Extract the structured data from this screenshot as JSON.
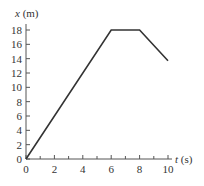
{
  "chart_data": {
    "type": "line",
    "title": "",
    "xlabel": "t (s)",
    "xlabel_var": "t",
    "xlabel_unit": "(s)",
    "ylabel": "x (m)",
    "ylabel_var": "x",
    "ylabel_unit": "(m)",
    "xlim": [
      0,
      10
    ],
    "ylim": [
      0,
      18
    ],
    "x_ticks": [
      "0",
      "2",
      "4",
      "6",
      "8",
      "10"
    ],
    "x_minor_ticks": [
      1,
      3,
      5,
      7,
      9
    ],
    "y_ticks": [
      "0",
      "2",
      "4",
      "6",
      "8",
      "10",
      "12",
      "14",
      "16",
      "18"
    ],
    "grid": false,
    "legend": null,
    "series": [
      {
        "name": "position",
        "color": "#333333",
        "x": [
          0,
          6,
          8,
          10
        ],
        "y": [
          0,
          18,
          18,
          13.7
        ]
      }
    ]
  }
}
